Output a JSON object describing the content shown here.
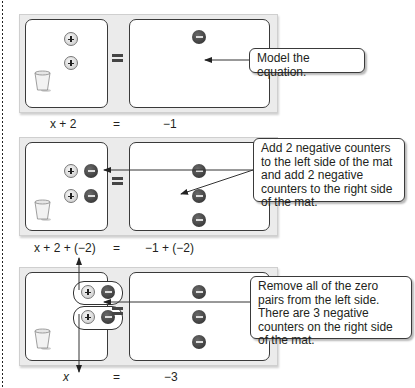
{
  "steps": [
    {
      "left_counters": [
        "positive",
        "positive"
      ],
      "right_counters": [
        "negative"
      ],
      "expression": {
        "left": "x + 2",
        "equals": "=",
        "right": "−1"
      },
      "callout": "Model the equation."
    },
    {
      "left_counters": [
        "positive",
        "negative",
        "positive",
        "negative"
      ],
      "right_counters": [
        "negative",
        "negative",
        "negative"
      ],
      "expression": {
        "left": "x + 2 + (−2)",
        "equals": "=",
        "right": "−1 + (−2)"
      },
      "callout": "Add 2 negative counters to the left side of the mat and add 2 negative counters to the right side of the mat."
    },
    {
      "left_counters": [
        "zero-pair",
        "zero-pair"
      ],
      "right_counters": [
        "negative",
        "negative",
        "negative"
      ],
      "expression": {
        "left": "x",
        "equals": "=",
        "right": "−3"
      },
      "callout": "Remove all of the zero pairs from the left side. There are 3 negative counters on the right side of the mat."
    }
  ],
  "colors": {
    "negative_counter": "#3a3a3a",
    "positive_counter": "#d9d9d9",
    "mat_frame": "#ebebeb",
    "border": "#3a3a3a"
  }
}
